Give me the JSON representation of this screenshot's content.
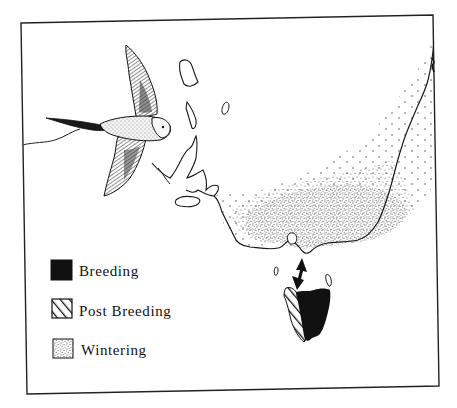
{
  "figure": {
    "type": "species distribution map",
    "region": "south-eastern Australia and Tasmania",
    "frame_color": "#222222",
    "background": "#ffffff"
  },
  "legend": {
    "items": [
      {
        "label": "Breeding",
        "pattern": "solid",
        "color": "#111111"
      },
      {
        "label": "Post Breeding",
        "pattern": "diagonal-hatch",
        "color": "#111111"
      },
      {
        "label": "Wintering",
        "pattern": "stipple",
        "color": "#555555"
      }
    ]
  },
  "annotations": {
    "migration_arrow": "double-headed arrow across Bass Strait between Victoria and Tasmania"
  }
}
